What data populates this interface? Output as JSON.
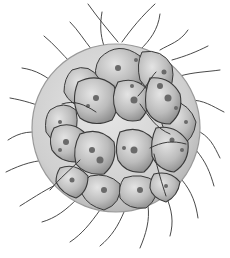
{
  "image": {
    "subject": "colonial-alga-illustration",
    "description": "Grayscale illustration of a spherical colony of flagellated cells enclosed in a translucent gelatinous envelope",
    "width": 230,
    "height": 258,
    "colors": {
      "background": "#ffffff",
      "envelope_fill": "#d6d6d6",
      "envelope_edge": "#9a9a9a",
      "cell_fill": "#b4b4b4",
      "cell_highlight": "#e2e2e2",
      "cell_outline": "#3a3a3a",
      "spot": "#6a6a6a",
      "flagella": "#4a4a4a"
    },
    "colony": {
      "center": [
        116,
        128
      ],
      "radius": 84,
      "cell_count_visible": 16
    }
  }
}
